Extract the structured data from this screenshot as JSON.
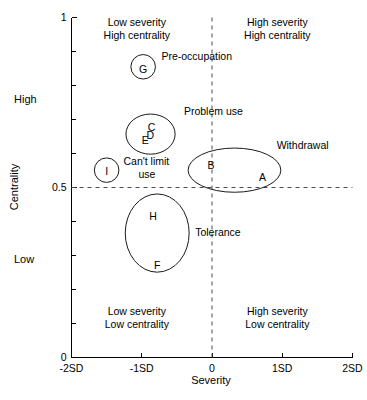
{
  "chart_data": {
    "type": "scatter",
    "title": "",
    "xlabel": "Severity",
    "ylabel": "Centrality",
    "xlim": [
      -2,
      2
    ],
    "ylim": [
      0,
      1
    ],
    "grid": false,
    "legend": "none",
    "x_tick_labels": [
      "-2SD",
      "-1SD",
      "0",
      "1SD",
      "2SD"
    ],
    "x_tick_values": [
      -2,
      -1,
      0,
      1,
      2
    ],
    "y_tick_labels": [
      "0",
      "0.5",
      "1"
    ],
    "y_tick_values": [
      0,
      0.5,
      1
    ],
    "y_minor_ticks": [
      0.1,
      0.2,
      0.3,
      0.4,
      0.6,
      0.7,
      0.8,
      0.9
    ],
    "y_axis_anchors": [
      {
        "text": "High",
        "value": 0.76
      },
      {
        "text": "Low",
        "value": 0.29
      }
    ],
    "reference_lines": [
      {
        "orientation": "vertical",
        "value": 0,
        "style": "dashed"
      },
      {
        "orientation": "horizontal",
        "value": 0.5,
        "style": "dashed"
      }
    ],
    "quadrant_labels": [
      {
        "id": "top-left",
        "line1": "Low severity",
        "line2": "High centrality",
        "x": -1.07,
        "y": 0.975
      },
      {
        "id": "top-right",
        "line1": "High severity",
        "line2": "High centrality",
        "x": 0.93,
        "y": 0.975
      },
      {
        "id": "bottom-left",
        "line1": "Low severity",
        "line2": "Low centrality",
        "x": -1.07,
        "y": 0.125
      },
      {
        "id": "bottom-right",
        "line1": "High severity",
        "line2": "Low centrality",
        "x": 0.93,
        "y": 0.125
      }
    ],
    "clusters": [
      {
        "id": "pre-occupation",
        "label": "Pre-occupation",
        "shape": "ellipse",
        "cx": -0.98,
        "cy": 0.855,
        "rx": 0.175,
        "ry": 0.036,
        "label_x": -0.72,
        "label_y": 0.875,
        "nodes": [
          {
            "letter": "G",
            "x": -0.98,
            "y": 0.848
          }
        ]
      },
      {
        "id": "problem-use",
        "label": "Problem use",
        "shape": "ellipse",
        "cx": -0.875,
        "cy": 0.657,
        "rx": 0.35,
        "ry": 0.059,
        "label_x": -0.4,
        "label_y": 0.712,
        "nodes": [
          {
            "letter": "C",
            "x": -0.86,
            "y": 0.678
          },
          {
            "letter": "D",
            "x": -0.88,
            "y": 0.652
          },
          {
            "letter": "E",
            "x": -0.95,
            "y": 0.64
          }
        ]
      },
      {
        "id": "cant-limit-use",
        "label": "Can't limit use",
        "label_line1": "Can't limit",
        "label_line2": "use",
        "shape": "circle",
        "cx": -1.5,
        "cy": 0.551,
        "rx": 0.175,
        "ry": 0.036,
        "label_x": -1.26,
        "label_y": 0.565,
        "nodes": [
          {
            "letter": "I",
            "x": -1.5,
            "y": 0.548
          }
        ]
      },
      {
        "id": "withdrawal",
        "label": "Withdrawal",
        "shape": "ellipse",
        "cx": 0.32,
        "cy": 0.551,
        "rx": 0.66,
        "ry": 0.065,
        "label_x": 0.92,
        "label_y": 0.612,
        "nodes": [
          {
            "letter": "B",
            "x": -0.015,
            "y": 0.565
          },
          {
            "letter": "A",
            "x": 0.72,
            "y": 0.531
          }
        ]
      },
      {
        "id": "tolerance",
        "label": "Tolerance",
        "shape": "ellipse",
        "cx": -0.78,
        "cy": 0.366,
        "rx": 0.455,
        "ry": 0.115,
        "label_x": -0.24,
        "label_y": 0.358,
        "nodes": [
          {
            "letter": "H",
            "x": -0.84,
            "y": 0.414
          },
          {
            "letter": "F",
            "x": -0.78,
            "y": 0.272
          }
        ]
      }
    ]
  },
  "figure": {
    "background_color": "#ffffff",
    "axis_color": "#000000",
    "refline_color": "#4a4a4a",
    "bubble_stroke": "#1a1a1a"
  }
}
